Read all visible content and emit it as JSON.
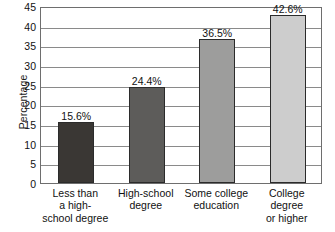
{
  "chart_data": {
    "type": "bar",
    "title": "",
    "xlabel": "",
    "ylabel": "Percentage",
    "ylim": [
      0,
      45
    ],
    "ytick_step": 5,
    "grid": true,
    "legend": "none",
    "categories": [
      "Less than a high-school degree",
      "High-school degree",
      "Some college education",
      "College degree or higher"
    ],
    "category_lines": [
      [
        "Less than",
        "a high-",
        "school degree"
      ],
      [
        "High-school",
        "degree"
      ],
      [
        "Some college",
        "education"
      ],
      [
        "College",
        "degree",
        "or higher"
      ]
    ],
    "values": [
      15.6,
      24.4,
      36.5,
      42.6
    ],
    "value_labels": [
      "15.6%",
      "24.4%",
      "36.5%",
      "42.6%"
    ],
    "ytick_labels": [
      "0",
      "5",
      "10",
      "15",
      "20",
      "25",
      "30",
      "35",
      "40",
      "45"
    ],
    "bar_colors": [
      "#3a3734",
      "#5d5c5a",
      "#9d9d9c",
      "#cdcdcd"
    ],
    "bar_border_color": "#2b2b2b",
    "axis_color": "#6e6e6e",
    "gridline_color": "#8a8a8a"
  }
}
